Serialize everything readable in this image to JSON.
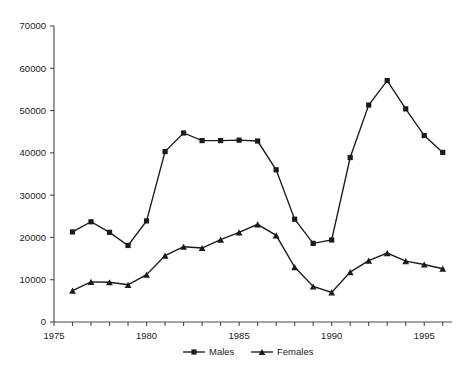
{
  "chart_data": {
    "type": "line",
    "title": "",
    "xlabel": "",
    "ylabel": "",
    "xlim": [
      1975,
      1996.5
    ],
    "ylim": [
      0,
      70000
    ],
    "grid": false,
    "legend_position": "bottom",
    "x": [
      1976,
      1977,
      1978,
      1979,
      1980,
      1981,
      1982,
      1983,
      1984,
      1985,
      1986,
      1987,
      1988,
      1989,
      1990,
      1991,
      1992,
      1993,
      1994,
      1995,
      1996
    ],
    "xticks": [
      1975,
      1980,
      1985,
      1990,
      1995
    ],
    "xticklabels": [
      "1975",
      "1980",
      "1985",
      "1990",
      "1995"
    ],
    "yticks": [
      0,
      10000,
      20000,
      30000,
      40000,
      50000,
      60000,
      70000
    ],
    "yticklabels": [
      "0",
      "10000",
      "20000",
      "30000",
      "40000",
      "50000",
      "60000",
      "70000"
    ],
    "series": [
      {
        "name": "Males",
        "marker": "square",
        "color": "#1a1a1a",
        "values": [
          21300,
          23700,
          21200,
          18100,
          23900,
          40300,
          44700,
          42900,
          42900,
          43000,
          42800,
          36000,
          24300,
          18600,
          19400,
          38900,
          51300,
          57100,
          50400,
          44100,
          40100
        ]
      },
      {
        "name": "Females",
        "marker": "triangle",
        "color": "#1a1a1a",
        "values": [
          7400,
          9500,
          9400,
          8800,
          11200,
          15700,
          17800,
          17500,
          19500,
          21200,
          23100,
          20500,
          13000,
          8400,
          7000,
          11800,
          14500,
          16300,
          14400,
          13600,
          12600
        ]
      }
    ]
  },
  "legend": {
    "items": [
      {
        "label": "Males"
      },
      {
        "label": "Females"
      }
    ]
  }
}
